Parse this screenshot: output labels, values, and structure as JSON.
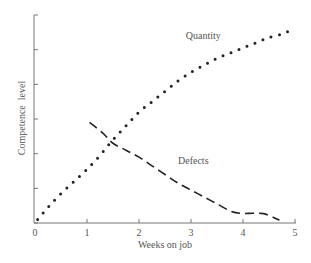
{
  "chart_data": {
    "type": "line",
    "title": "",
    "xlabel": "Weeks on job",
    "ylabel": "Competence  level",
    "xlim": [
      0,
      5
    ],
    "ylim": [
      0,
      6
    ],
    "x_ticks": [
      "0",
      "1",
      "2",
      "3",
      "4",
      "5"
    ],
    "y_ticks_count": 7,
    "y_tick_labels_shown": false,
    "grid": false,
    "legend": "inline labels",
    "series": [
      {
        "name": "Quantity",
        "style": "dotted",
        "label_position": {
          "x": 2.9,
          "y": 5.3
        },
        "points": [
          [
            0.05,
            0.1
          ],
          [
            0.25,
            0.45
          ],
          [
            0.5,
            0.85
          ],
          [
            0.75,
            1.2
          ],
          [
            1.0,
            1.55
          ],
          [
            1.25,
            1.95
          ],
          [
            1.5,
            2.4
          ],
          [
            1.75,
            2.8
          ],
          [
            2.0,
            3.2
          ],
          [
            2.25,
            3.5
          ],
          [
            2.5,
            3.8
          ],
          [
            2.75,
            4.1
          ],
          [
            3.0,
            4.35
          ],
          [
            3.25,
            4.55
          ],
          [
            3.5,
            4.75
          ],
          [
            3.75,
            4.9
          ],
          [
            4.0,
            5.05
          ],
          [
            4.25,
            5.2
          ],
          [
            4.5,
            5.35
          ],
          [
            4.75,
            5.45
          ],
          [
            4.9,
            5.55
          ]
        ]
      },
      {
        "name": "Defects",
        "style": "dashed",
        "label_position": {
          "x": 2.75,
          "y": 1.7
        },
        "points": [
          [
            1.05,
            2.9
          ],
          [
            1.3,
            2.6
          ],
          [
            1.5,
            2.3
          ],
          [
            1.75,
            2.1
          ],
          [
            2.0,
            1.9
          ],
          [
            2.25,
            1.65
          ],
          [
            2.5,
            1.4
          ],
          [
            2.75,
            1.15
          ],
          [
            3.0,
            0.95
          ],
          [
            3.25,
            0.75
          ],
          [
            3.5,
            0.55
          ],
          [
            3.75,
            0.35
          ],
          [
            3.95,
            0.28
          ],
          [
            4.2,
            0.28
          ],
          [
            4.4,
            0.27
          ],
          [
            4.6,
            0.15
          ],
          [
            4.7,
            0.08
          ]
        ]
      }
    ]
  },
  "colors": {
    "axis": "#777777",
    "series": "#222222",
    "text": "#555555"
  }
}
